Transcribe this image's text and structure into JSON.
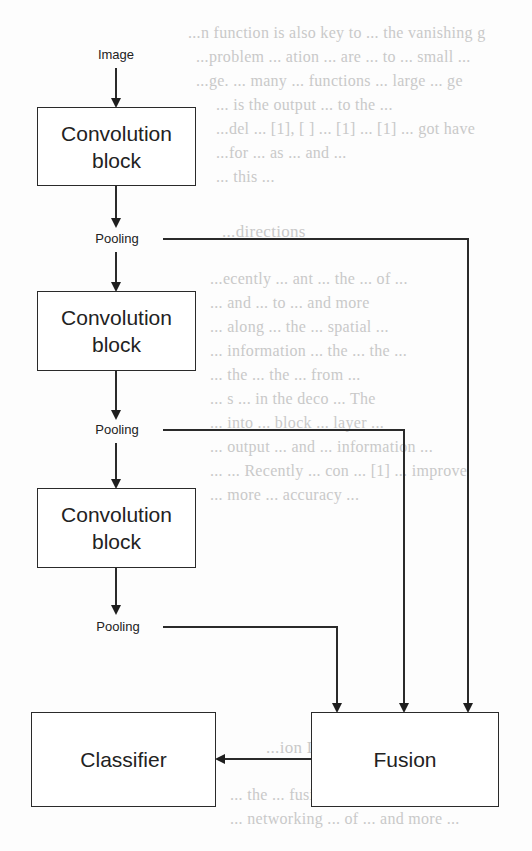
{
  "diagram": {
    "input_label": "Image",
    "blocks": [
      {
        "line1": "Convolution",
        "line2": "block"
      },
      {
        "line1": "Convolution",
        "line2": "block"
      },
      {
        "line1": "Convolution",
        "line2": "block"
      }
    ],
    "pooling_labels": [
      "Pooling",
      "Pooling",
      "Pooling"
    ],
    "fusion_label": "Fusion",
    "classifier_label": "Classifier",
    "colors": {
      "stroke": "#2a2a2a",
      "background": "#fdfdfd",
      "bleed_text": "#c9c9c9"
    }
  },
  "background_bleed_text": [
    "...n function is also key to ... the vanishing g",
    "...problem ... ation ... are ... to ... small ...",
    "...ge. ... many ... functions ... large ... ge",
    "... is the output ... to the ... ",
    "...del ... [1], [ ] ... [1] ... [1] ... got have",
    "...for ... as ... and ...",
    "... this ...",
    "...directions",
    "...ecently ... ant ... the ... of ...",
    "... and ... to ... and more",
    "... along ... the ... spatial ...",
    "... information ... the ... the ...",
    "... the ... the ... from ...",
    "... s ... in the deco ... The",
    "... into ... block ... layer ...",
    "... output ... and ... information ...",
    "... ... Recently ... con ... [1] ... improve",
    "... more ... accuracy ...",
    "...ion Learning Networks",
    "... the ... fusion the ...",
    "... networking ... of ... and more ..."
  ]
}
